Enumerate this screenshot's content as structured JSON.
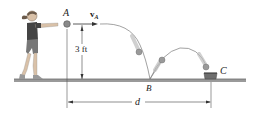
{
  "figure": {
    "labels": {
      "point_a": "A",
      "velocity": "v",
      "velocity_sub": "A",
      "height": "3 ft",
      "point_b": "B",
      "point_c": "C",
      "distance": "d"
    },
    "colors": {
      "ground": "#8a8a8a",
      "trajectory": "#7a7a7a",
      "ball": "#9a9a9a",
      "cup": "#6e6e6e",
      "text": "#222222"
    }
  }
}
